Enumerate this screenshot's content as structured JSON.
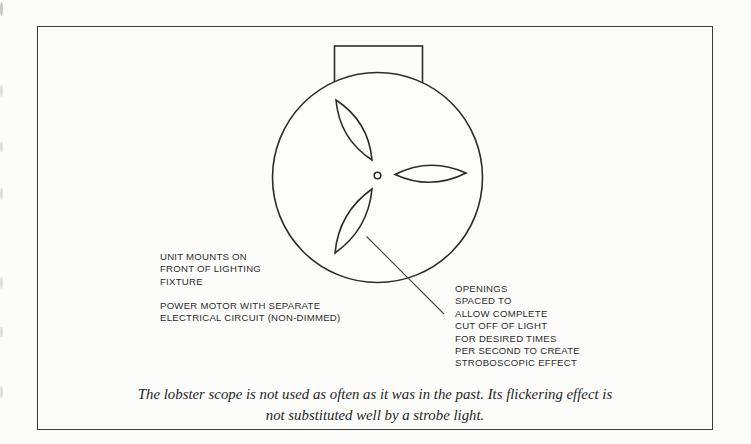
{
  "figure": {
    "labels": {
      "unit_mounts": "UNIT MOUNTS ON\nFRONT OF LIGHTING\nFIXTURE",
      "power_motor": "POWER MOTOR WITH SEPARATE\nELECTRICAL CIRCUIT (NON-DIMMED)",
      "openings": "OPENINGS\nSPACED TO\nALLOW COMPLETE\nCUT OFF OF LIGHT\nFOR DESIRED TIMES\nPER SECOND TO CREATE\nSTROBOSCOPIC EFFECT"
    },
    "caption": "The lobster scope is not used as often as it was in the past. Its flickering effect is\nnot substituted well by a strobe light.",
    "colors": {
      "ink": "#2c2c2c",
      "frame": "#3a3a3a",
      "background": "#fcfcfb"
    }
  }
}
